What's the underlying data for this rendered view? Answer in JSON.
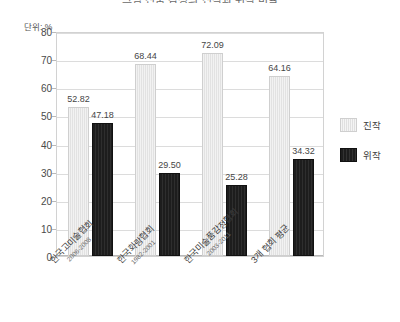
{
  "chart_data": {
    "type": "bar",
    "title": "그림 진품 감정의 진작과 위작 비율",
    "unit_label": "단위: %",
    "xlabel": "",
    "ylabel": "",
    "ylim": [
      0,
      80
    ],
    "yticks": [
      80,
      70,
      60,
      50,
      40,
      30,
      20,
      10,
      0
    ],
    "grid": true,
    "legend_position": "right",
    "categories": [
      "한국고미술협회",
      "한국화랑협회",
      "한국미술품감정협회",
      "3개 협회 평균"
    ],
    "category_years": [
      "2006-2008",
      "1982-2001",
      "2003-2011",
      ""
    ],
    "series": [
      {
        "name": "진작",
        "color": "#e8e8e8",
        "values": [
          52.82,
          68.44,
          72.09,
          64.16
        ]
      },
      {
        "name": "위작",
        "color": "#1d1d1d",
        "values": [
          47.18,
          29.5,
          25.28,
          34.32
        ]
      }
    ],
    "value_labels": {
      "series_0": [
        "52.82",
        "68.44",
        "72.09",
        "64.16"
      ],
      "series_1": [
        "47.18",
        "29.50",
        "25.28",
        "34.32"
      ]
    }
  }
}
